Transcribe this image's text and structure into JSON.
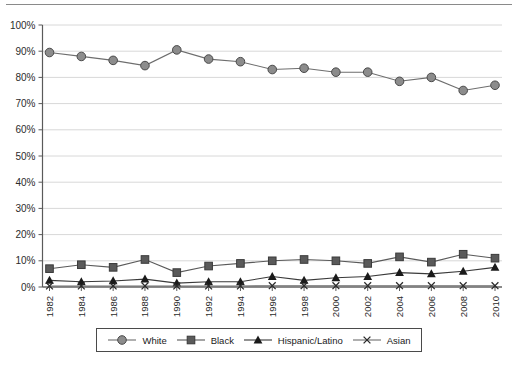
{
  "chart_data": {
    "type": "line",
    "title": "",
    "subtitle": "",
    "xlabel": "",
    "ylabel": "",
    "categories": [
      "1982",
      "1984",
      "1986",
      "1988",
      "1990",
      "1992",
      "1994",
      "1996",
      "1998",
      "2000",
      "2002",
      "2004",
      "2006",
      "2008",
      "2010"
    ],
    "x_tick_labels": [
      "1982",
      "1984",
      "1986",
      "1988",
      "1990",
      "1992",
      "1994",
      "1996",
      "1998",
      "2000",
      "2002",
      "2004",
      "2006",
      "2008",
      "2010"
    ],
    "y_tick_labels": [
      "0%",
      "10%",
      "20%",
      "30%",
      "40%",
      "50%",
      "60%",
      "70%",
      "80%",
      "90%",
      "100%"
    ],
    "y_tick_values": [
      0,
      10,
      20,
      30,
      40,
      50,
      60,
      70,
      80,
      90,
      100
    ],
    "ylim": [
      0,
      100
    ],
    "grid": true,
    "grid_axis": "y",
    "legend_position": "bottom",
    "value_suffix": "%",
    "series": [
      {
        "name": "White",
        "marker": "circle",
        "color": "#8c8c8c",
        "line_color": "#6e6e6e",
        "values": [
          89.5,
          88.0,
          86.5,
          84.5,
          90.5,
          87.0,
          86.0,
          83.0,
          83.5,
          82.0,
          82.0,
          78.5,
          80.0,
          75.0,
          77.0
        ]
      },
      {
        "name": "Black",
        "marker": "square",
        "color": "#5a5a5a",
        "line_color": "#5a5a5a",
        "values": [
          7.0,
          8.5,
          7.5,
          10.5,
          5.5,
          8.0,
          9.0,
          10.0,
          10.5,
          10.0,
          9.0,
          11.5,
          9.5,
          12.5,
          11.0
        ]
      },
      {
        "name": "Hispanic/Latino",
        "marker": "triangle",
        "color": "#1a1a1a",
        "line_color": "#3a3a3a",
        "values": [
          2.5,
          2.0,
          2.3,
          3.0,
          1.5,
          2.0,
          2.0,
          4.0,
          2.5,
          3.5,
          4.0,
          5.5,
          5.0,
          6.0,
          7.5
        ]
      },
      {
        "name": "Asian",
        "marker": "x",
        "color": "#2b2b2b",
        "line_color": "#6e6e6e",
        "values": [
          0.4,
          0.4,
          0.4,
          0.4,
          0.4,
          0.4,
          0.4,
          0.5,
          0.5,
          0.5,
          0.5,
          0.5,
          0.5,
          0.5,
          0.5
        ]
      }
    ]
  },
  "legend": {
    "items": [
      {
        "label": "White",
        "marker": "circle-marker-icon"
      },
      {
        "label": "Black",
        "marker": "square-marker-icon"
      },
      {
        "label": "Hispanic/Latino",
        "marker": "triangle-marker-icon"
      },
      {
        "label": "Asian",
        "marker": "x-marker-icon"
      }
    ]
  },
  "axes": {
    "y_labels": [
      "100%",
      "90%",
      "80%",
      "70%",
      "60%",
      "50%",
      "40%",
      "30%",
      "20%",
      "10%",
      "0%"
    ],
    "x_labels": [
      "1982",
      "1984",
      "1986",
      "1988",
      "1990",
      "1992",
      "1994",
      "1996",
      "1998",
      "2000",
      "2002",
      "2004",
      "2006",
      "2008",
      "2010"
    ]
  }
}
